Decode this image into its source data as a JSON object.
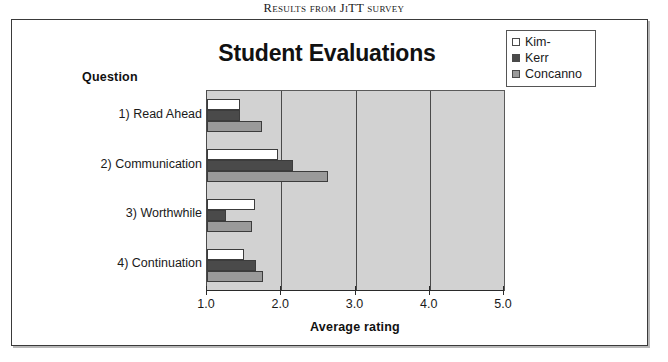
{
  "figure": {
    "caption": "Results from JiTT survey"
  },
  "chart_data": {
    "type": "bar",
    "orientation": "horizontal",
    "title": "Student Evaluations",
    "xlabel": "Average rating",
    "ylabel": "Question",
    "xlim": [
      1.0,
      5.0
    ],
    "xticks": [
      "1.0",
      "2.0",
      "3.0",
      "4.0",
      "5.0"
    ],
    "xtick_values": [
      1.0,
      2.0,
      3.0,
      4.0,
      5.0
    ],
    "grid": true,
    "legend_position": "top-right",
    "categories": [
      "1) Read Ahead",
      "2) Communication",
      "3) Worthwhile",
      "4) Continuation"
    ],
    "series": [
      {
        "name": "Kim-",
        "color": "#ffffff",
        "values": [
          1.45,
          1.96,
          1.65,
          1.5
        ]
      },
      {
        "name": "Kerr",
        "color": "#4a4a4a",
        "values": [
          1.45,
          2.16,
          1.26,
          1.66
        ]
      },
      {
        "name": "Concanno",
        "color": "#9a9a9a",
        "values": [
          1.74,
          2.63,
          1.61,
          1.75
        ]
      }
    ],
    "plot_background": "#d2d2d2"
  }
}
